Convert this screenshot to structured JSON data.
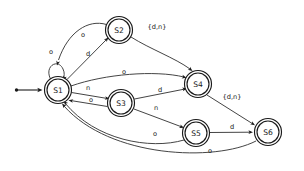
{
  "diagram": {
    "kind": "finite-state-machine",
    "width": 304,
    "height": 171,
    "background_color": "#ffffff",
    "node_stroke_color": "#1a1a1a",
    "edge_stroke_color": "#3a3a3a",
    "label_color": "#1a1a1a",
    "alphabet": [
      "o",
      "d",
      "n"
    ]
  },
  "start": {
    "target": "S1",
    "marker": "arrow-with-dot"
  },
  "states": [
    {
      "id": "S1",
      "label": "S1",
      "cx": 58,
      "cy": 90,
      "r_outer": 13.5,
      "r_inner": 11.0,
      "accepting": true
    },
    {
      "id": "S2",
      "label": "S2",
      "cx": 119,
      "cy": 30,
      "r_outer": 13.5,
      "r_inner": 11.0,
      "accepting": true
    },
    {
      "id": "S3",
      "label": "S3",
      "cx": 121,
      "cy": 103,
      "r_outer": 13.5,
      "r_inner": 11.0,
      "accepting": true
    },
    {
      "id": "S4",
      "label": "S4",
      "cx": 198,
      "cy": 84,
      "r_outer": 13.5,
      "r_inner": 11.0,
      "accepting": true
    },
    {
      "id": "S5",
      "label": "S5",
      "cx": 196,
      "cy": 133,
      "r_outer": 13.5,
      "r_inner": 11.0,
      "accepting": true
    },
    {
      "id": "S6",
      "label": "S6",
      "cx": 268,
      "cy": 132,
      "r_outer": 13.5,
      "r_inner": 11.0,
      "accepting": true
    }
  ],
  "transitions": [
    {
      "id": "t-s1-self",
      "from": "S1",
      "to": "S1",
      "label": "o",
      "label_x": 51,
      "label_y": 52,
      "path": "M 50.5 79 C 44 66, 58 58, 63 69 C 65 73, 64 76, 63.5 79.5",
      "arrow_x": 63.5,
      "arrow_y": 80.5,
      "arrow_angle": 108
    },
    {
      "id": "t-s2-s1",
      "from": "S2",
      "to": "S1",
      "label": "o",
      "label_x": 83,
      "label_y": 35,
      "path": "M 106.5 24.5 C 88 19, 68 32, 58.5 60",
      "arrow_x": 57.0,
      "arrow_y": 65.5,
      "arrow_angle": 105
    },
    {
      "id": "t-s1-s2",
      "from": "S1",
      "to": "S2",
      "label": "d",
      "label_x": 88,
      "label_y": 54,
      "path": "M 67 79.5 L 106.5 39.5",
      "arrow_x": 108.5,
      "arrow_y": 37.5,
      "arrow_angle": -45
    },
    {
      "id": "t-s2-s4",
      "from": "S2",
      "to": "S4",
      "label": "{d,n}",
      "label_x": 157,
      "label_y": 27,
      "path": "M 131 37 C 150 49, 175 58, 190 69",
      "arrow_x": 192.5,
      "arrow_y": 71.0,
      "arrow_angle": 38
    },
    {
      "id": "t-s1-s4",
      "from": "S1",
      "to": "S4",
      "label": "o",
      "label_x": 124,
      "label_y": 72,
      "path": "M 71 86 C 105 74, 155 70, 184 77",
      "arrow_x": 186.5,
      "arrow_y": 77.8,
      "arrow_angle": 15
    },
    {
      "id": "t-s1-s3",
      "from": "S1",
      "to": "S3",
      "label": "n",
      "label_x": 88,
      "label_y": 88,
      "path": "M 71.5 92.5 L 107.5 98.5",
      "arrow_x": 109.5,
      "arrow_y": 98.8,
      "arrow_angle": 10
    },
    {
      "id": "t-s3-s1",
      "from": "S3",
      "to": "S1",
      "label": "o",
      "label_x": 91,
      "label_y": 100,
      "path": "M 107.5 106.5 L 70.5 100.5",
      "arrow_x": 68.5,
      "arrow_y": 100.2,
      "arrow_angle": 190
    },
    {
      "id": "t-s3-s4",
      "from": "S3",
      "to": "S4",
      "label": "d",
      "label_x": 160,
      "label_y": 90,
      "path": "M 134.5 99 L 185 89",
      "arrow_x": 187.0,
      "arrow_y": 88.6,
      "arrow_angle": -11
    },
    {
      "id": "t-s3-s5",
      "from": "S3",
      "to": "S5",
      "label": "n",
      "label_x": 156,
      "label_y": 108,
      "path": "M 134 109 L 182 127",
      "arrow_x": 184.0,
      "arrow_y": 127.8,
      "arrow_angle": 21
    },
    {
      "id": "t-s4-s6",
      "from": "S4",
      "to": "S6",
      "label": "{d,n}",
      "label_x": 232,
      "label_y": 97,
      "path": "M 207 95 L 253 124",
      "arrow_x": 255.0,
      "arrow_y": 125.2,
      "arrow_angle": 32
    },
    {
      "id": "t-s5-s6",
      "from": "S5",
      "to": "S6",
      "label": "d",
      "label_x": 232,
      "label_y": 127,
      "path": "M 209.5 132.5 L 251 132.2",
      "arrow_x": 253.0,
      "arrow_y": 132.2,
      "arrow_angle": 0
    },
    {
      "id": "t-s5-s1",
      "from": "S5",
      "to": "S1",
      "label": "o",
      "label_x": 155,
      "label_y": 134,
      "path": "M 184 140 C 150 150, 95 140, 65 103",
      "arrow_x": 63.5,
      "arrow_y": 101.0,
      "arrow_angle": -135
    },
    {
      "id": "t-s6-s1",
      "from": "S6",
      "to": "S1",
      "label": "o",
      "label_x": 210,
      "label_y": 151,
      "path": "M 256 141 C 215 162, 110 158, 64 106",
      "arrow_x": 62.0,
      "arrow_y": 103.5,
      "arrow_angle": -132
    }
  ]
}
